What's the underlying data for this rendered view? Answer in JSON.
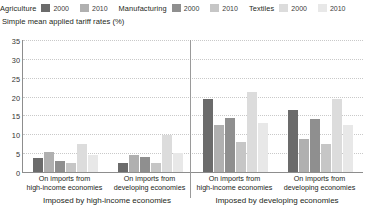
{
  "subtitle": "Simple mean applied tariff rates (%)",
  "legend": [
    {
      "category": "Agriculture",
      "entries": [
        {
          "year": "2000",
          "color": "#6b6b6b"
        },
        {
          "year": "2010",
          "color": "#b0b0b0"
        }
      ]
    },
    {
      "category": "Manufacturing",
      "entries": [
        {
          "year": "2000",
          "color": "#8f8f8f"
        },
        {
          "year": "2010",
          "color": "#c6c6c6"
        }
      ]
    },
    {
      "category": "Textiles",
      "entries": [
        {
          "year": "2000",
          "color": "#dcdcdc"
        },
        {
          "year": "2010",
          "color": "#e8e8e8"
        }
      ]
    }
  ],
  "axis": {
    "yticks": [
      "0",
      "5",
      "10",
      "15",
      "20",
      "25",
      "30",
      "35"
    ],
    "ymin": 0,
    "ymax": 35
  },
  "xaxis": {
    "categories": [
      {
        "line1": "On imports from",
        "line2": "high-income economies"
      },
      {
        "line1": "On imports from",
        "line2": "developing economies"
      },
      {
        "line1": "On imports from",
        "line2": "high-income economies"
      },
      {
        "line1": "On imports from",
        "line2": "developing economies"
      }
    ],
    "groups": [
      "Imposed by high-income economies",
      "Imposed by developing economies"
    ]
  },
  "chart_data": {
    "type": "bar",
    "title": "Simple mean applied tariff rates (%)",
    "xlabel": "",
    "ylabel": "",
    "ylim": [
      0,
      35
    ],
    "ytick_step": 5,
    "grid": true,
    "legend_position": "top",
    "categories": [
      "Imposed by high-income economies / On imports from high-income economies",
      "Imposed by high-income economies / On imports from developing economies",
      "Imposed by developing economies / On imports from high-income economies",
      "Imposed by developing economies / On imports from developing economies"
    ],
    "series": [
      {
        "name": "Agriculture 2000",
        "color": "#6b6b6b",
        "values": [
          3.8,
          2.3,
          19.3,
          16.4
        ]
      },
      {
        "name": "Agriculture 2010",
        "color": "#b0b0b0",
        "values": [
          5.2,
          4.6,
          12.5,
          8.8
        ]
      },
      {
        "name": "Manufacturing 2000",
        "color": "#8f8f8f",
        "values": [
          2.9,
          4.0,
          14.4,
          14.0
        ]
      },
      {
        "name": "Manufacturing 2010",
        "color": "#c6c6c6",
        "values": [
          2.3,
          2.4,
          8.0,
          7.5
        ]
      },
      {
        "name": "Textiles 2000",
        "color": "#dcdcdc",
        "values": [
          7.5,
          9.9,
          21.2,
          19.3
        ]
      },
      {
        "name": "Textiles 2010",
        "color": "#e8e8e8",
        "values": [
          4.5,
          5.0,
          13.0,
          12.5
        ]
      }
    ]
  }
}
